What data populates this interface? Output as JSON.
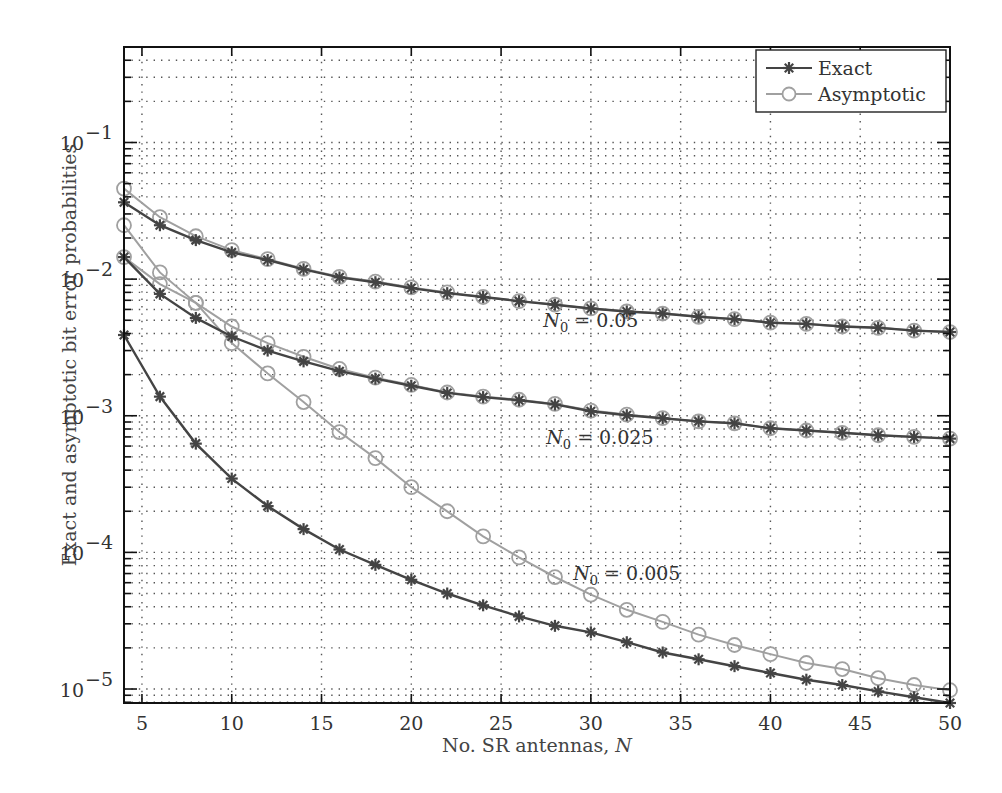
{
  "chart_data": {
    "type": "line",
    "title": "",
    "xlabel": "No. SR antennas, N",
    "xlabel_parts": {
      "text": "No. SR antennas, ",
      "var": "N"
    },
    "ylabel": "Exact and asymptotic bit error probabilities",
    "xscale": "linear",
    "yscale": "log",
    "xlim": [
      4,
      50
    ],
    "ylim": [
      7.9e-06,
      0.5
    ],
    "xticks": [
      5,
      10,
      15,
      20,
      25,
      30,
      35,
      40,
      45,
      50
    ],
    "yticks": [
      {
        "exp": -1,
        "label": "10",
        "sup": "−1"
      },
      {
        "exp": -2,
        "label": "10",
        "sup": "−2"
      },
      {
        "exp": -3,
        "label": "10",
        "sup": "−3"
      },
      {
        "exp": -4,
        "label": "10",
        "sup": "−4"
      },
      {
        "exp": -5,
        "label": "10",
        "sup": "−5"
      }
    ],
    "grid": true,
    "legend": {
      "position": "upper right",
      "entries": [
        {
          "label": "Exact",
          "marker": "asterisk",
          "color": "#444444"
        },
        {
          "label": "Asymptotic",
          "marker": "circle",
          "color": "#a0a0a0"
        }
      ]
    },
    "x": [
      4,
      6,
      8,
      10,
      12,
      14,
      16,
      18,
      20,
      22,
      24,
      26,
      28,
      30,
      32,
      34,
      36,
      38,
      40,
      42,
      44,
      46,
      48,
      50
    ],
    "series": [
      {
        "name": "Exact, N0 = 0.05",
        "kind": "Exact",
        "N0": 0.05,
        "values": [
          0.0365,
          0.0248,
          0.0193,
          0.0157,
          0.0138,
          0.0118,
          0.0103,
          0.0095,
          0.0086,
          0.0079,
          0.0074,
          0.0069,
          0.0065,
          0.0061,
          0.0058,
          0.0056,
          0.0053,
          0.0051,
          0.0048,
          0.0047,
          0.0045,
          0.0044,
          0.0042,
          0.0041
        ]
      },
      {
        "name": "Asymptotic, N0 = 0.05",
        "kind": "Asymptotic",
        "N0": 0.05,
        "values": [
          0.046,
          0.0284,
          0.0206,
          0.0163,
          0.014,
          0.0119,
          0.0104,
          0.0096,
          0.0087,
          0.008,
          0.0074,
          0.0069,
          0.0065,
          0.0061,
          0.0058,
          0.0056,
          0.0053,
          0.0051,
          0.0048,
          0.0047,
          0.0045,
          0.0044,
          0.0042,
          0.0041
        ]
      },
      {
        "name": "Exact, N0 = 0.025",
        "kind": "Exact",
        "N0": 0.025,
        "values": [
          0.0145,
          0.0078,
          0.0052,
          0.0038,
          0.003,
          0.0025,
          0.00212,
          0.00187,
          0.00166,
          0.00147,
          0.00137,
          0.0013,
          0.00121,
          0.00108,
          0.00101,
          0.00096,
          0.00091,
          0.00088,
          0.00081,
          0.00078,
          0.00075,
          0.00072,
          0.0007,
          0.00068
        ]
      },
      {
        "name": "Asymptotic, N0 = 0.025",
        "kind": "Asymptotic",
        "N0": 0.025,
        "values": [
          0.0248,
          0.0112,
          0.0067,
          0.0045,
          0.0034,
          0.0027,
          0.0022,
          0.0019,
          0.00168,
          0.00148,
          0.00138,
          0.00131,
          0.00122,
          0.00109,
          0.00102,
          0.00096,
          0.00091,
          0.00088,
          0.00081,
          0.00078,
          0.00075,
          0.00072,
          0.0007,
          0.00068
        ]
      },
      {
        "name": "Exact, N0 = 0.005",
        "kind": "Exact",
        "N0": 0.005,
        "values": [
          0.0039,
          0.00138,
          0.000625,
          0.000347,
          0.000218,
          0.000148,
          0.000105,
          8.1e-05,
          6.3e-05,
          5e-05,
          4.1e-05,
          3.4e-05,
          2.9e-05,
          2.6e-05,
          2.2e-05,
          1.85e-05,
          1.65e-05,
          1.47e-05,
          1.31e-05,
          1.17e-05,
          1.07e-05,
          9.6e-06,
          8.7e-06,
          7.9e-06
        ]
      },
      {
        "name": "Asymptotic, N0 = 0.005",
        "kind": "Asymptotic",
        "N0": 0.005,
        "values": [
          0.0145,
          0.0092,
          0.0067,
          0.0034,
          0.00204,
          0.00126,
          0.00076,
          0.00049,
          0.0003,
          0.0002,
          0.000131,
          9.2e-05,
          6.6e-05,
          4.9e-05,
          3.8e-05,
          3.1e-05,
          2.5e-05,
          2.1e-05,
          1.8e-05,
          1.55e-05,
          1.4e-05,
          1.2e-05,
          1.07e-05,
          9.8e-06
        ]
      }
    ],
    "annotations": [
      {
        "text": "N0 = 0.05",
        "var": "N",
        "sub": "0",
        "rest": " = 0.05",
        "x": 30,
        "y": 0.0045
      },
      {
        "text": "N0 = 0.025",
        "var": "N",
        "sub": "0",
        "rest": " = 0.025",
        "x": 30.5,
        "y": 0.00062
      },
      {
        "text": "N0 = 0.005",
        "var": "N",
        "sub": "0",
        "rest": " = 0.005",
        "x": 32,
        "y": 6.3e-05
      }
    ],
    "colors": {
      "exact": "#444444",
      "asymptotic": "#a0a0a0",
      "axes": "#111111",
      "grid": "#555555"
    }
  }
}
